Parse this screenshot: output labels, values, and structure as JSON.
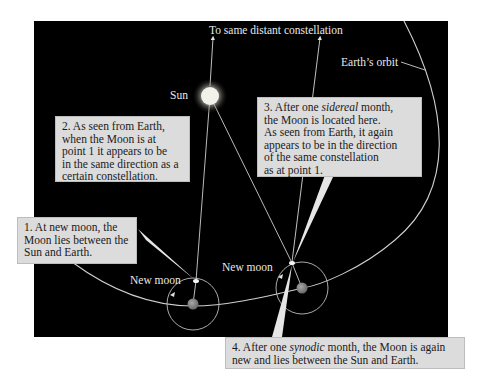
{
  "figure": {
    "colors": {
      "background": "#000000",
      "page": "#ffffff",
      "callout_fill": "#dcdcdc",
      "callout_text": "#1a1a1a",
      "label_text": "#e8e8e8",
      "orbit_line": "#cfcfcf",
      "sun": "#f2f2ea",
      "earth": "#8a8a8a",
      "moon": "#f4f4f4",
      "pointer": "#e6e6e6"
    },
    "labels": {
      "top_direction": "To same distant constellation",
      "earth_orbit": "Earth’s orbit",
      "sun": "Sun",
      "new_moon_1": "New moon",
      "new_moon_2": "New moon"
    },
    "callouts": [
      {
        "id": "1",
        "lines": [
          "1. At new moon, the",
          "Moon lies between the",
          "Sun and Earth."
        ]
      },
      {
        "id": "2",
        "lines": [
          "2. As seen from Earth,",
          "when the Moon is at",
          "point 1 it appears to be",
          "in the same direction as a",
          "certain constellation."
        ]
      },
      {
        "id": "3",
        "line1_prefix": "3. After one ",
        "line1_emph": "sidereal",
        "line1_suffix": " month,",
        "lines": [
          "the Moon is located here.",
          "As seen from Earth, it again",
          "appears to be in the direction",
          "of the same constellation",
          "as at point 1."
        ]
      },
      {
        "id": "4",
        "line1_prefix": "4. After one ",
        "line1_emph": "synodic",
        "line1_suffix": " month, the Moon is again",
        "lines": [
          "new and lies between the Sun and Earth."
        ]
      }
    ]
  }
}
